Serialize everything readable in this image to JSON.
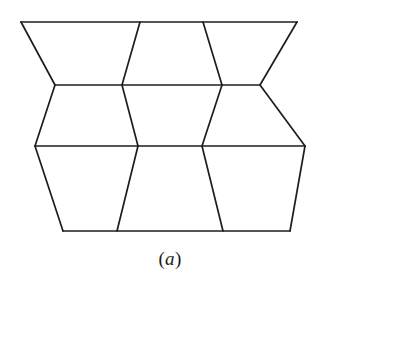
{
  "figure": {
    "caption_open_paren": "(",
    "caption_letter": "a",
    "caption_close_paren": ")",
    "caption_full": "(a)",
    "background_color": "#ffffff",
    "stroke_color": "#1f1d1c",
    "stroke_width": 1.7,
    "canvas": {
      "width": 397,
      "height": 356
    },
    "rows": [
      {
        "name": "top-band",
        "y": 22,
        "x_start": 21,
        "x_end": 297,
        "vertex_x": [
          140,
          203
        ]
      },
      {
        "name": "upper-mid-line",
        "y": 85,
        "vertex_x": [
          55,
          122,
          222,
          260
        ]
      },
      {
        "name": "lower-mid-line",
        "y": 146,
        "vertex_x": [
          35,
          138,
          202,
          305
        ]
      },
      {
        "name": "bottom-band",
        "y": 231,
        "x_start": 63,
        "x_end": 290,
        "vertex_x": [
          117,
          223
        ]
      }
    ],
    "polylines": [
      {
        "name": "top-horizontal-edge",
        "points": "21,22 297,22"
      },
      {
        "name": "upper-horizontal-edge",
        "points": "55,85 260,85"
      },
      {
        "name": "middle-horizontal-edge",
        "points": "35,146 305,146"
      },
      {
        "name": "bottom-horizontal-edge",
        "points": "63,231 290,231"
      },
      {
        "name": "left-outer-edge-upper",
        "points": "21,22 55,85"
      },
      {
        "name": "left-outer-edge-lower",
        "points": "55,85 35,146"
      },
      {
        "name": "left-outer-edge-bottom",
        "points": "35,146 63,231"
      },
      {
        "name": "right-outer-edge-upper",
        "points": "297,22 260,85"
      },
      {
        "name": "right-outer-edge-lower",
        "points": "260,85 305,146"
      },
      {
        "name": "right-outer-edge-bottom",
        "points": "305,146 290,231"
      },
      {
        "name": "inner-edge-col1-top",
        "points": "140,22 122,85"
      },
      {
        "name": "inner-edge-col2-top",
        "points": "203,22 222,85"
      },
      {
        "name": "inner-edge-col1-mid",
        "points": "122,85 138,146"
      },
      {
        "name": "inner-edge-col2-mid",
        "points": "222,85 202,146"
      },
      {
        "name": "inner-edge-col1-bottom",
        "points": "138,146 117,231"
      },
      {
        "name": "inner-edge-col2-bottom",
        "points": "202,146 223,231"
      }
    ]
  }
}
